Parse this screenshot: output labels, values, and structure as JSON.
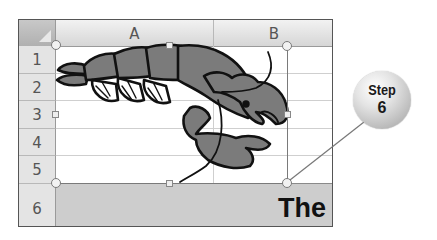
{
  "spreadsheet": {
    "columns": [
      {
        "label": "A"
      },
      {
        "label": "B"
      }
    ],
    "rows": [
      {
        "label": "1"
      },
      {
        "label": "2"
      },
      {
        "label": "3"
      },
      {
        "label": "4"
      },
      {
        "label": "5"
      },
      {
        "label": "6"
      }
    ],
    "cells": {
      "B6": "The"
    },
    "picture": {
      "name": "lobster-clipart",
      "selected": true
    }
  },
  "callout": {
    "line1": "Step",
    "line2": "6"
  },
  "colors": {
    "grid": "#cfcfcf",
    "header": "#e4e4e4",
    "row6_fill": "#cdcdcd",
    "lobster_fill": "#7b7b7b",
    "selection": "#7a7a7a"
  }
}
